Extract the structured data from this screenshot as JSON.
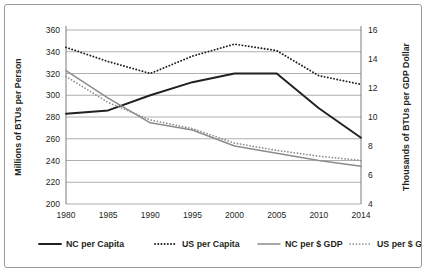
{
  "chart_data": {
    "type": "line",
    "title": "",
    "xlabel": "",
    "ylabel": "Millions of BTUs per Person",
    "y2label": "Thousands of BTUs per GDP Dollar",
    "x": [
      1980,
      1985,
      1990,
      1995,
      2000,
      2005,
      2010,
      2014
    ],
    "categories": [
      "1980",
      "1985",
      "1990",
      "1995",
      "2000",
      "2005",
      "2010",
      "2014"
    ],
    "ylim": [
      200,
      360
    ],
    "y2lim": [
      4,
      16
    ],
    "yticks": [
      200,
      220,
      240,
      260,
      280,
      300,
      320,
      340,
      360
    ],
    "y2ticks": [
      4,
      6,
      8,
      10,
      12,
      14,
      16
    ],
    "grid": true,
    "legend_position": "bottom",
    "series": [
      {
        "name": "NC per Capita",
        "axis": "left",
        "style": "solid",
        "color": "#231f20",
        "width": 1.9,
        "values": [
          283,
          286,
          300,
          312,
          320,
          320,
          288,
          261
        ]
      },
      {
        "name": "US per Capita",
        "axis": "left",
        "style": "dotted",
        "color": "#231f20",
        "width": 1.9,
        "values": [
          344,
          331,
          320,
          336,
          347,
          341,
          318,
          310
        ]
      },
      {
        "name": "NC per $ GDP",
        "axis": "right",
        "style": "solid",
        "color": "#8c8c8c",
        "width": 1.5,
        "values": [
          13.2,
          11.3,
          9.6,
          9.1,
          8.0,
          7.5,
          7.0,
          6.6
        ]
      },
      {
        "name": "US per $ GDP",
        "axis": "right",
        "style": "dotted",
        "color": "#8c8c8c",
        "width": 1.7,
        "values": [
          12.8,
          11.0,
          9.8,
          9.2,
          8.2,
          7.7,
          7.3,
          7.0
        ]
      }
    ]
  },
  "legend": {
    "items": [
      {
        "label": "NC per Capita"
      },
      {
        "label": "US per Capita"
      },
      {
        "label": "NC per $ GDP"
      },
      {
        "label": "US per $ GDP"
      }
    ]
  }
}
